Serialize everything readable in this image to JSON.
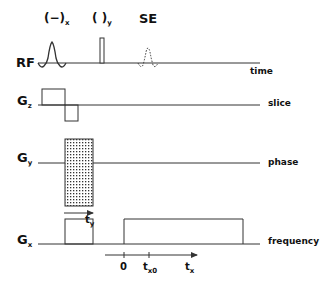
{
  "diagram": {
    "colors": {
      "line": "#333333",
      "text": "#111111",
      "background": "#ffffff"
    },
    "rows": [
      {
        "id": "rf",
        "name": "RF",
        "sub": "",
        "side_label": "time"
      },
      {
        "id": "gz",
        "name": "G",
        "sub": "z",
        "side_label": "slice"
      },
      {
        "id": "gy",
        "name": "G",
        "sub": "y",
        "side_label": "phase"
      },
      {
        "id": "gx",
        "name": "G",
        "sub": "x",
        "side_label": "frequency"
      }
    ],
    "pulses": {
      "excitation": {
        "main": "(−)",
        "sub": "x",
        "shape": "sinc"
      },
      "refocus": {
        "main": "( )",
        "sub": "y",
        "shape": "narrow-rect"
      },
      "echo": {
        "main": "SE",
        "sub": "",
        "shape": "dashed-sinc"
      }
    },
    "phase_arrow": {
      "main": "t",
      "sub": "y"
    },
    "time_axis": {
      "ticks": [
        {
          "main": "0",
          "sub": ""
        },
        {
          "main": "t",
          "sub": "x0"
        }
      ],
      "end_label": {
        "main": "t",
        "sub": "x"
      }
    }
  }
}
